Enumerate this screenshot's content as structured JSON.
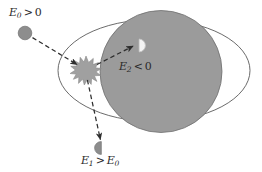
{
  "figure": {
    "background_color": "#ffffff",
    "width": 262,
    "height": 172
  },
  "labels": {
    "incoming": {
      "name": "E0-greater-than-zero",
      "symbol": "E",
      "subscript": "0",
      "operator": ">",
      "value": "0",
      "text": "E0 > 0"
    },
    "bound": {
      "name": "E2-less-than-zero",
      "symbol": "E",
      "subscript": "2",
      "operator": "<",
      "value": "0",
      "text": "E2 < 0"
    },
    "outgoing": {
      "name": "E1-greater-than-E0",
      "symbol": "E",
      "subscript": "1",
      "operator": ">",
      "value_symbol": "E",
      "value_subscript": "0",
      "text": "E1 > E0"
    }
  },
  "shapes": {
    "outer_ellipse": {
      "name": "outer-ellipse",
      "cx": 154,
      "cy": 70.5,
      "rx": 96,
      "ry": 51,
      "stroke": "#5a5a5a",
      "fill": "none",
      "stroke_width": 0.9
    },
    "gray_disc": {
      "name": "gray-disc",
      "cx": 161,
      "cy": 71.5,
      "r": 61,
      "fill": "#9b9b9b",
      "stroke": "#6e6e6e",
      "stroke_width": 0.8
    },
    "incoming_particle": {
      "name": "incoming-particle",
      "cx": 25,
      "cy": 33,
      "r": 6.8,
      "fill": "#8d8d8d",
      "stroke": "#6e6e6e"
    },
    "burst": {
      "name": "collision-burst",
      "cx": 86,
      "cy": 68,
      "r_outer": 12,
      "r_inner": 6.5,
      "points": 14,
      "fill": "#a0a0a0",
      "stroke": "#8a8a8a"
    },
    "captured_particle": {
      "name": "captured-particle-halfdisc",
      "cx": 139,
      "cy": 45,
      "r": 6.5,
      "fill": "#f2f2f2",
      "stroke": "#c2c2c2",
      "orientation": "flat-left"
    },
    "ejected_particle": {
      "name": "ejected-particle-halfdisc",
      "cx": 101,
      "cy": 148,
      "r": 6.5,
      "fill": "#8d8d8d",
      "stroke": "#7a7a7a",
      "orientation": "flat-right"
    }
  },
  "arrows": [
    {
      "name": "arrow-incoming",
      "from_x": 33,
      "from_y": 38,
      "to_x": 76,
      "to_y": 64,
      "style": "dashed",
      "color": "#2e2e2e"
    },
    {
      "name": "arrow-captured",
      "from_x": 97,
      "from_y": 64,
      "to_x": 132,
      "to_y": 46,
      "style": "dashed",
      "color": "#2e2e2e"
    },
    {
      "name": "arrow-ejected",
      "from_x": 88,
      "from_y": 80,
      "to_x": 100,
      "to_y": 139,
      "style": "dashed",
      "color": "#2e2e2e"
    }
  ]
}
